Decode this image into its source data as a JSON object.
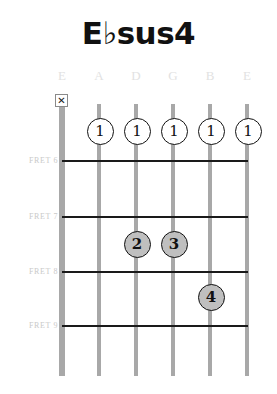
{
  "chord": {
    "title": "E♭sus4",
    "name_plain": "Ebsus4"
  },
  "string_names": [
    {
      "label": "E",
      "x": 62
    },
    {
      "label": "A",
      "x": 99
    },
    {
      "label": "D",
      "x": 136
    },
    {
      "label": "G",
      "x": 173
    },
    {
      "label": "B",
      "x": 210
    },
    {
      "label": "E",
      "x": 247
    }
  ],
  "fret_labels": [
    {
      "label": "FRET 6",
      "y": 156
    },
    {
      "label": "FRET 7",
      "y": 212
    },
    {
      "label": "FRET 8",
      "y": 267
    },
    {
      "label": "FRET 9",
      "y": 321
    }
  ],
  "fret_lines": [
    {
      "y": 160
    },
    {
      "y": 216
    },
    {
      "y": 271
    },
    {
      "y": 325
    }
  ],
  "strings": [
    {
      "x": 62,
      "bass": true
    },
    {
      "x": 99,
      "bass": false
    },
    {
      "x": 136,
      "bass": false
    },
    {
      "x": 173,
      "bass": false
    },
    {
      "x": 210,
      "bass": false
    },
    {
      "x": 247,
      "bass": false
    }
  ],
  "mute_markers": [
    {
      "symbol": "✕",
      "x": 62,
      "y": 94,
      "string_label": "E"
    }
  ],
  "finger_dots": [
    {
      "finger": "1",
      "x": 100,
      "y": 131,
      "style": "open",
      "string_label": "A",
      "fret": 6
    },
    {
      "finger": "1",
      "x": 137,
      "y": 131,
      "style": "open",
      "string_label": "D",
      "fret": 6
    },
    {
      "finger": "1",
      "x": 174,
      "y": 131,
      "style": "open",
      "string_label": "G",
      "fret": 6
    },
    {
      "finger": "1",
      "x": 211,
      "y": 131,
      "style": "open",
      "string_label": "B",
      "fret": 6
    },
    {
      "finger": "1",
      "x": 248,
      "y": 131,
      "style": "open",
      "string_label": "E",
      "fret": 6
    },
    {
      "finger": "2",
      "x": 137,
      "y": 244,
      "style": "filled",
      "string_label": "D",
      "fret": 8
    },
    {
      "finger": "3",
      "x": 174,
      "y": 244,
      "style": "filled",
      "string_label": "G",
      "fret": 8
    },
    {
      "finger": "4",
      "x": 211,
      "y": 297,
      "style": "filled",
      "string_label": "B",
      "fret": 9
    }
  ],
  "colors": {
    "title_text": "#111111",
    "string": "#a8a8a8",
    "fret_line": "#1a1a1a",
    "fret_label_text": "#c9c9c9",
    "string_name_text": "#e2e2e2",
    "dot_open_fill": "#ffffff",
    "dot_filled_fill": "#bfbfbf",
    "dot_border": "#111111",
    "background": "#ffffff"
  }
}
